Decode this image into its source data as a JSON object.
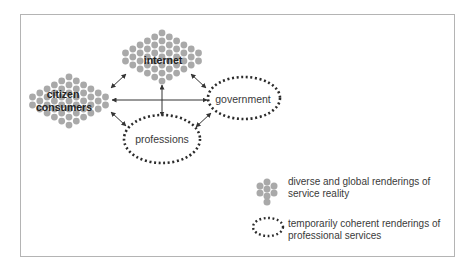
{
  "diagram": {
    "nodes": [
      {
        "id": "internet",
        "label": "internet",
        "style": "dot-cluster"
      },
      {
        "id": "citizen",
        "label_line1": "citizen",
        "label_line2": "consumers",
        "style": "dot-cluster"
      },
      {
        "id": "government",
        "label": "government",
        "style": "dotted-ellipse"
      },
      {
        "id": "professions",
        "label": "professions",
        "style": "dotted-ellipse"
      }
    ],
    "edges": [
      {
        "from": "citizen",
        "to": "internet",
        "bidirectional": true
      },
      {
        "from": "internet",
        "to": "government",
        "bidirectional": true
      },
      {
        "from": "citizen",
        "to": "government",
        "bidirectional": true
      },
      {
        "from": "internet",
        "to": "professions",
        "bidirectional": true
      },
      {
        "from": "citizen",
        "to": "professions",
        "bidirectional": true
      },
      {
        "from": "professions",
        "to": "government",
        "bidirectional": true
      }
    ],
    "labels": {
      "internet": "internet",
      "citizen_line1": "citizen",
      "citizen_line2": "consumers",
      "government": "government",
      "professions": "professions"
    }
  },
  "legend": {
    "items": [
      {
        "symbol": "dot-cluster",
        "line1": "diverse and global renderings of",
        "line2": "service reality"
      },
      {
        "symbol": "dotted-ellipse",
        "line1": "temporarily coherent renderings of",
        "line2": "professional services"
      }
    ]
  },
  "colors": {
    "dot": "#a9a9a9",
    "dotted_border": "#2b2b2b",
    "arrow": "#333333",
    "frame": "#b4b4b4"
  }
}
